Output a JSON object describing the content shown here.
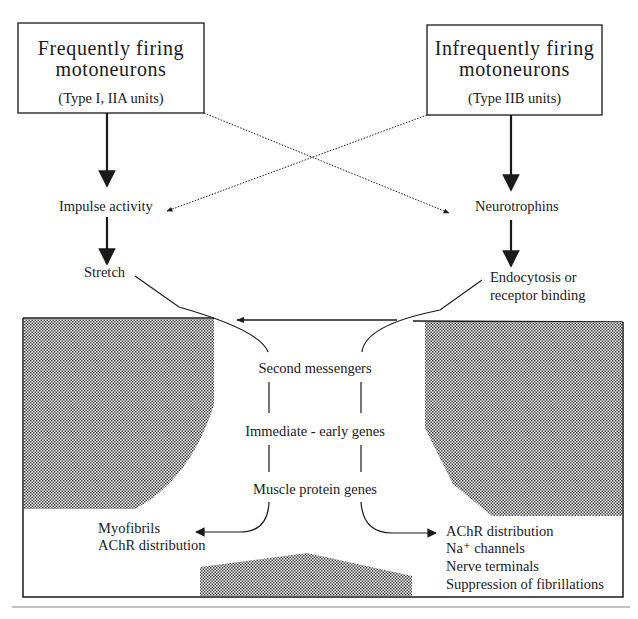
{
  "diagram": {
    "left_box": {
      "title_line1": "Frequently firing",
      "title_line2": "motoneurons",
      "subtitle": "(Type I, IIA units)"
    },
    "right_box": {
      "title_line1": "Infrequently firing",
      "title_line2": "motoneurons",
      "subtitle": "(Type IIB units)"
    },
    "left_chain": {
      "step1": "Impulse activity",
      "step2": "Stretch"
    },
    "right_chain": {
      "step1": "Neurotrophins",
      "step2_line1": "Endocytosis or",
      "step2_line2": "receptor binding"
    },
    "muscle_cell": {
      "pathway": [
        "Second messengers",
        "Immediate - early genes",
        "Muscle protein genes"
      ],
      "left_outputs": [
        "Myofibrils",
        "AChR distribution"
      ],
      "right_outputs": [
        "AChR distribution",
        "Na⁺ channels",
        "Nerve terminals",
        "Suppression of fibrillations"
      ]
    },
    "colors": {
      "line": "#1a1a1a",
      "stipple": "#5a5a5a",
      "background": "#ffffff",
      "footer_rule": "#888888"
    }
  }
}
